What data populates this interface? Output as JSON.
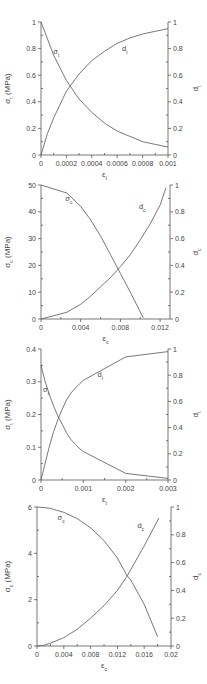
{
  "chart_data": [
    {
      "type": "line",
      "title": "",
      "xlabel": "ε_t",
      "ylabel": "σ_t (MPa)",
      "y2label": "d_t",
      "xlim": [
        0,
        0.001
      ],
      "ylim": [
        0,
        1
      ],
      "y2lim": [
        0,
        1
      ],
      "xticks": [
        0,
        0.0002,
        0.0004,
        0.0006,
        0.0008,
        0.001
      ],
      "xtick_labels": [
        "0",
        "0.0002",
        "0.0004",
        "0.0006",
        "0.0008",
        "0.001"
      ],
      "yticks": [
        0,
        0.2,
        0.4,
        0.6,
        0.8,
        1
      ],
      "ytick_labels": [
        "0",
        "0.2",
        "0.4",
        "0.6",
        "0.8",
        "1"
      ],
      "y2ticks": [
        0,
        0.2,
        0.4,
        0.6,
        0.8,
        1
      ],
      "y2tick_labels": [
        "0",
        "0.2",
        "0.4",
        "0.6",
        "0.8",
        "1"
      ],
      "grid": false,
      "frame": {
        "top": 22,
        "bottom": 155,
        "left": 41,
        "right": 168
      },
      "series": [
        {
          "name": "σ_t",
          "axis": "left",
          "label_pos": [
            0.00012,
            0.76
          ],
          "x": [
            0,
            0.0001,
            0.0002,
            0.0003,
            0.0004,
            0.0005,
            0.0006,
            0.0007,
            0.0008,
            0.0009,
            0.001
          ],
          "y": [
            1,
            0.75,
            0.56,
            0.42,
            0.32,
            0.24,
            0.18,
            0.14,
            0.1,
            0.08,
            0.06
          ]
        },
        {
          "name": "d_t",
          "axis": "right",
          "label_pos": [
            0.00066,
            0.78
          ],
          "x": [
            0,
            5e-05,
            0.0001,
            0.0002,
            0.0003,
            0.0004,
            0.0005,
            0.0006,
            0.0007,
            0.0008,
            0.0009,
            0.001
          ],
          "y": [
            0,
            0.16,
            0.28,
            0.48,
            0.61,
            0.71,
            0.78,
            0.84,
            0.88,
            0.91,
            0.93,
            0.95
          ]
        }
      ]
    },
    {
      "type": "line",
      "title": "",
      "xlabel": "ε_c",
      "ylabel": "σ_c (MPa)",
      "y2label": "d_c",
      "xlim": [
        0,
        0.013
      ],
      "ylim": [
        0,
        50
      ],
      "y2lim": [
        0,
        1
      ],
      "xticks": [
        0,
        0.004,
        0.008,
        0.012
      ],
      "xtick_labels": [
        "0",
        "0.004",
        "0.008",
        "0.012"
      ],
      "yticks": [
        0,
        10,
        20,
        30,
        40,
        50
      ],
      "ytick_labels": [
        "0",
        "10",
        "20",
        "30",
        "40",
        "50"
      ],
      "y2ticks": [
        0,
        0.2,
        0.4,
        0.6,
        0.8,
        1
      ],
      "y2tick_labels": [
        "0",
        "0.2",
        "0.4",
        "0.6",
        "0.8",
        "1"
      ],
      "grid": false,
      "frame": {
        "top": 185,
        "bottom": 319,
        "left": 41,
        "right": 170
      },
      "series": [
        {
          "name": "σ_c",
          "axis": "left",
          "label_pos": [
            0.0028,
            44
          ],
          "x": [
            0,
            0.0026,
            0.004,
            0.005,
            0.006,
            0.007,
            0.008,
            0.009,
            0.0103
          ],
          "y": [
            50,
            47,
            42,
            37,
            31,
            24,
            17,
            10,
            0.5
          ]
        },
        {
          "name": "d_c",
          "axis": "right",
          "label_pos": [
            0.0102,
            0.82
          ],
          "x": [
            0,
            0.0026,
            0.004,
            0.005,
            0.006,
            0.007,
            0.008,
            0.009,
            0.01,
            0.011,
            0.012,
            0.0126
          ],
          "y": [
            0,
            0.05,
            0.11,
            0.17,
            0.24,
            0.31,
            0.39,
            0.48,
            0.59,
            0.71,
            0.85,
            0.98
          ]
        }
      ]
    },
    {
      "type": "line",
      "title": "",
      "xlabel": "ε_t",
      "ylabel": "σ_t (MPa)",
      "y2label": "d_t",
      "xlim": [
        0,
        0.003
      ],
      "ylim": [
        0,
        0.4
      ],
      "y2lim": [
        0,
        1
      ],
      "xticks": [
        0,
        0.001,
        0.002,
        0.003
      ],
      "xtick_labels": [
        "0",
        "0.001",
        "0.002",
        "0.003"
      ],
      "yticks": [
        0,
        0.1,
        0.2,
        0.3,
        0.4
      ],
      "ytick_labels": [
        "0",
        "0.1",
        "0.2",
        "0.3",
        "0.4"
      ],
      "y2ticks": [
        0,
        0.2,
        0.4,
        0.6,
        0.8,
        1
      ],
      "y2tick_labels": [
        "0",
        "0.2",
        "0.4",
        "0.6",
        "0.8",
        "1"
      ],
      "grid": false,
      "frame": {
        "top": 349,
        "bottom": 480,
        "left": 41,
        "right": 168
      },
      "series": [
        {
          "name": "σ_t",
          "axis": "left",
          "label_pos": [
            0.00012,
            0.27
          ],
          "x": [
            0,
            0.0001,
            0.0002,
            0.0003,
            0.0004,
            0.0005,
            0.0006,
            0.0007,
            0.0008,
            0.0009,
            0.001,
            0.002,
            0.003
          ],
          "y": [
            0.35,
            0.3,
            0.26,
            0.225,
            0.195,
            0.17,
            0.145,
            0.125,
            0.11,
            0.097,
            0.087,
            0.02,
            0.005
          ]
        },
        {
          "name": "d_t",
          "axis": "right",
          "label_pos": [
            0.0014,
            0.79
          ],
          "x": [
            0,
            0.0001,
            0.0002,
            0.0003,
            0.0004,
            0.0005,
            0.0006,
            0.0007,
            0.0008,
            0.0009,
            0.001,
            0.002,
            0.003
          ],
          "y": [
            0,
            0.13,
            0.26,
            0.37,
            0.46,
            0.54,
            0.61,
            0.66,
            0.7,
            0.73,
            0.76,
            0.94,
            0.98
          ]
        }
      ]
    },
    {
      "type": "line",
      "title": "",
      "xlabel": "ε_c",
      "ylabel": "σ_c (MPa)",
      "y2label": "d_c",
      "xlim": [
        0,
        0.02
      ],
      "ylim": [
        0,
        6
      ],
      "y2lim": [
        0,
        1
      ],
      "xticks": [
        0,
        0.004,
        0.008,
        0.012,
        0.016,
        0.02
      ],
      "xtick_labels": [
        "0",
        "0.004",
        "0.008",
        "0.012",
        "0.016",
        "0.02"
      ],
      "yticks": [
        0,
        2,
        4,
        6
      ],
      "ytick_labels": [
        "0",
        "2",
        "4",
        "6"
      ],
      "y2ticks": [
        0,
        0.2,
        0.4,
        0.6,
        0.8,
        1
      ],
      "y2tick_labels": [
        "0",
        "0.2",
        "0.4",
        "0.6",
        "0.8",
        "1"
      ],
      "grid": false,
      "frame": {
        "top": 507,
        "bottom": 646,
        "left": 37,
        "right": 171
      },
      "series": [
        {
          "name": "σ_c",
          "axis": "left",
          "label_pos": [
            0.0036,
            5.45
          ],
          "x": [
            0,
            0.001,
            0.002,
            0.004,
            0.006,
            0.008,
            0.01,
            0.012,
            0.0134,
            0.014,
            0.016,
            0.018
          ],
          "y": [
            6,
            5.98,
            5.94,
            5.77,
            5.5,
            5.1,
            4.55,
            3.8,
            3.05,
            2.85,
            1.8,
            0.4
          ]
        },
        {
          "name": "d_c",
          "axis": "right",
          "label_pos": [
            0.0155,
            0.85
          ],
          "x": [
            0,
            0.001,
            0.002,
            0.004,
            0.006,
            0.008,
            0.01,
            0.012,
            0.0134,
            0.014,
            0.016,
            0.0182
          ],
          "y": [
            0,
            0.005,
            0.02,
            0.06,
            0.12,
            0.2,
            0.29,
            0.4,
            0.5,
            0.55,
            0.72,
            0.92
          ]
        }
      ]
    }
  ]
}
